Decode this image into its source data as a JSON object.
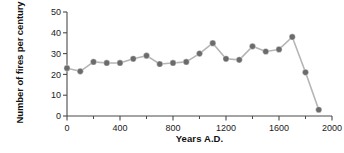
{
  "chart_data": {
    "type": "line",
    "title": "",
    "xlabel": "Years A.D.",
    "ylabel": "Number of fires per century",
    "x": [
      0,
      100,
      200,
      300,
      400,
      500,
      600,
      700,
      800,
      900,
      1000,
      1100,
      1200,
      1300,
      1400,
      1500,
      1600,
      1700,
      1800,
      1900
    ],
    "values": [
      23,
      21.5,
      26,
      25.5,
      25.5,
      27.5,
      29,
      25,
      25.5,
      26,
      30,
      35,
      27.5,
      27,
      33.5,
      31,
      32,
      38,
      21,
      3
    ],
    "xlim": [
      0,
      2000
    ],
    "ylim": [
      0,
      50
    ],
    "xticks": [
      0,
      400,
      800,
      1200,
      1600,
      2000
    ],
    "xticklabels": [
      "0",
      "400",
      "800",
      "1200",
      "1600",
      "2000"
    ],
    "xminorticks": [
      200,
      600,
      1000,
      1400,
      1800
    ],
    "yticks": [
      0,
      10,
      20,
      30,
      40,
      50
    ],
    "yticklabels": [
      "0",
      "10",
      "20",
      "30",
      "40",
      "50"
    ],
    "grid": false,
    "legend": null,
    "marker_color": "#6b6b6b",
    "line_color": "#b5b5b5",
    "axis_color": "#4a4a4a",
    "background": "#ffffff"
  }
}
